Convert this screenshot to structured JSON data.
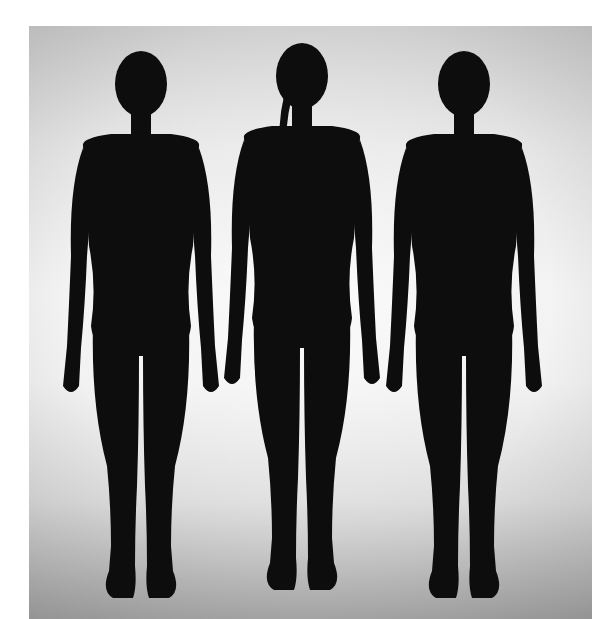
{
  "image": {
    "subject": "three female silhouettes standing side by side",
    "figures": [
      {
        "position": "left",
        "hair": "short bun"
      },
      {
        "position": "center",
        "hair": "braid"
      },
      {
        "position": "right",
        "hair": "short bun"
      }
    ],
    "colors": {
      "border": "#ffffff",
      "background_light": "#f4f4f4",
      "background_dark": "#a8a8a8",
      "silhouette": "#0d0d0d"
    }
  }
}
